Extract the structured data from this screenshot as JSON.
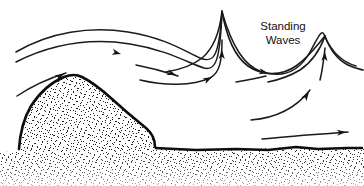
{
  "diagram": {
    "background_color": "#ffffff",
    "ink_color": "#111111",
    "width": 364,
    "height": 186,
    "labels": [
      {
        "id": "standing-waves",
        "line1": "Standing",
        "line2": "Waves",
        "x": 283,
        "y": 27
      }
    ],
    "terrain": {
      "name": "mountain-ridge",
      "fill_pattern": "stipple",
      "outline_color": "#0d0d0d",
      "peak": {
        "x": 80,
        "y": 77
      },
      "base_left": {
        "x": 20,
        "y": 147
      },
      "cliff_drop": {
        "x": 155,
        "y": 145
      }
    },
    "ground": {
      "name": "ground-surface",
      "fill_pattern": "stipple",
      "surface_y": 150
    },
    "flow": {
      "description": "Airflow streamlines with arrowheads showing lee waves",
      "streamline_count": 8,
      "arrow_count": 11
    }
  },
  "chart_data": {
    "type": "line",
    "title": "Standing Waves",
    "xlabel": "",
    "ylabel": "",
    "xlim": [
      0,
      364
    ],
    "ylim": [
      186,
      0
    ],
    "grid": false,
    "legend": null,
    "annotations": [
      {
        "text": "Standing Waves",
        "x": 283,
        "y": 30
      }
    ],
    "series": [
      {
        "name": "upper-streamline-1",
        "comment": "topmost smooth streamline entering from left",
        "path": "M 16,52 C 50,32 90,26 128,32 C 166,38 186,52 200,58 C 214,64 219,56 222,12",
        "arrows": []
      },
      {
        "name": "upper-streamline-2",
        "comment": "second streamline with arrowhead, dips to trough then up to crest 1",
        "path": "M 16,62 C 52,44 92,38 130,44 C 168,50 190,64 204,68 C 216,71 220,60 222,12",
        "arrows": [
          {
            "x": 121,
            "y": 54,
            "angle": 14
          }
        ]
      },
      {
        "name": "crest-1-descent",
        "comment": "lee side of first crest descending into trough then rising to crest 2",
        "path": "M 222,12 C 232,46 244,66 262,72 C 285,79 300,70 310,52 C 318,38 322,26 325,37",
        "arrows": [
          {
            "x": 268,
            "y": 73,
            "angle": 11
          }
        ]
      },
      {
        "name": "crest-2-descent",
        "comment": "lee side of second crest trailing off to the right edge",
        "path": "M 325,37 C 332,52 342,62 356,66",
        "arrows": []
      },
      {
        "name": "mid-arrow-streamline",
        "comment": "short mid-level streamline with arrowhead",
        "path": "M 136,65 C 152,68 166,72 178,76",
        "arrows": [
          {
            "x": 176,
            "y": 75,
            "angle": 19
          }
        ]
      },
      {
        "name": "lower-mid-streamline",
        "comment": "streamline rising from behind mountain to first crest",
        "path": "M 140,80 C 166,86 192,86 210,78 C 220,73 222,60 222,40",
        "arrows": [
          {
            "x": 212,
            "y": 77,
            "angle": -28
          },
          {
            "x": 222,
            "y": 50,
            "angle": -88
          }
        ]
      },
      {
        "name": "windward-streamline",
        "comment": "streamline climbing the windward slope of the mountain",
        "path": "M 17,96 C 32,86 50,78 66,73",
        "arrows": [
          {
            "x": 64,
            "y": 74,
            "angle": -26
          }
        ]
      },
      {
        "name": "lee-rotor-streamline",
        "comment": "streamline rising from lee floor to second crest",
        "path": "M 251,120 C 276,118 296,108 310,90",
        "arrows": [
          {
            "x": 309,
            "y": 92,
            "angle": -55
          }
        ]
      },
      {
        "name": "lee-crest2-riser",
        "comment": "short riser feeding the second crest interior",
        "path": "M 320,80 C 323,68 324,56 325,48",
        "arrows": [
          {
            "x": 325,
            "y": 52,
            "angle": -86
          }
        ]
      },
      {
        "name": "surface-streamline",
        "comment": "long near-surface streamline along flat ground",
        "path": "M 262,139 C 290,136 320,134 348,132",
        "arrows": [
          {
            "x": 346,
            "y": 132,
            "angle": -5
          }
        ]
      },
      {
        "name": "trough-lower-streamline",
        "comment": "short streamline in trough between crests",
        "path": "M 236,82 C 248,80 258,78 266,76",
        "arrows": []
      }
    ]
  }
}
